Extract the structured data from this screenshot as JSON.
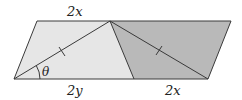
{
  "figure": {
    "points": {
      "top_left": [
        37,
        21
      ],
      "apex": [
        110,
        21
      ],
      "top_right": [
        231,
        21
      ],
      "bottom_left": [
        14,
        79
      ],
      "bottom_mid": [
        134,
        79
      ],
      "bottom_right": [
        208,
        79
      ]
    },
    "colors": {
      "light_fill": "#e6e6e6",
      "dark_fill": "#b9b9b9",
      "stroke": "#3a3a3a"
    },
    "labels": {
      "top": "2x",
      "bottom_left": "2y",
      "bottom_right": "2x",
      "angle": "θ"
    }
  }
}
